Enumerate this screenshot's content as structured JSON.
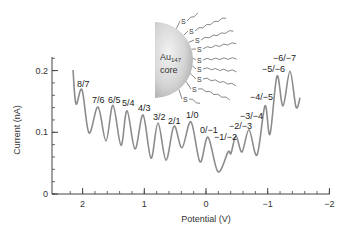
{
  "chart_data": {
    "type": "line",
    "title": "",
    "xlabel": "Potential (V)",
    "ylabel": "Current (nA)",
    "xlim": [
      2.3,
      -2.05
    ],
    "ylim": [
      0,
      0.22
    ],
    "x_reversed": true,
    "grid": false,
    "legend": null,
    "x_ticks": [
      2,
      1,
      0,
      -1,
      -2
    ],
    "x_tick_labels": [
      "2",
      "1",
      "0",
      "−1",
      "−2"
    ],
    "x_minor_step": 0.2,
    "y_ticks": [
      0,
      0.1,
      0.2
    ],
    "y_tick_labels": [
      "0",
      "0.1",
      "0.2"
    ],
    "y_minor_step": 0.02,
    "series": [
      {
        "name": "Au147 DPV",
        "color": "#8c8c8c",
        "x": [
          2.155,
          2.107,
          2.01,
          1.896,
          1.75,
          1.62,
          1.507,
          1.378,
          1.28,
          1.15,
          1.02,
          0.891,
          0.778,
          0.648,
          0.519,
          0.389,
          0.243,
          0.097,
          -0.032,
          -0.194,
          -0.357,
          -0.405,
          -0.486,
          -0.583,
          -0.697,
          -0.827,
          -0.956,
          -1.037,
          -1.15,
          -1.248,
          -1.361,
          -1.459,
          -1.524
        ],
        "y": [
          0.201,
          0.146,
          0.169,
          0.099,
          0.141,
          0.086,
          0.144,
          0.079,
          0.135,
          0.073,
          0.128,
          0.058,
          0.115,
          0.055,
          0.11,
          0.075,
          0.117,
          0.052,
          0.092,
          0.036,
          0.068,
          0.066,
          0.094,
          0.068,
          0.104,
          0.063,
          0.143,
          0.097,
          0.191,
          0.143,
          0.199,
          0.141,
          0.156
        ]
      }
    ],
    "annotations": [
      {
        "text": "8/7",
        "x": 2.01,
        "y": 0.169
      },
      {
        "text": "7/6",
        "x": 1.75,
        "y": 0.141
      },
      {
        "text": "6/5",
        "x": 1.507,
        "y": 0.144
      },
      {
        "text": "5/4",
        "x": 1.28,
        "y": 0.135
      },
      {
        "text": "4/3",
        "x": 1.02,
        "y": 0.128
      },
      {
        "text": "3/2",
        "x": 0.778,
        "y": 0.115
      },
      {
        "text": "2/1",
        "x": 0.519,
        "y": 0.11
      },
      {
        "text": "1/0",
        "x": 0.243,
        "y": 0.117
      },
      {
        "text": "0/−1",
        "x": -0.032,
        "y": 0.092
      },
      {
        "text": "−1/−2",
        "x": -0.486,
        "y": 0.094
      },
      {
        "text": "−2/−3",
        "x": -0.697,
        "y": 0.104
      },
      {
        "text": "−3/−4",
        "x": -0.956,
        "y": 0.143
      },
      {
        "text": "−4/−5",
        "x": -1.15,
        "y": 0.191
      },
      {
        "text": "−5/−6",
        "x": -1.361,
        "y": 0.199
      },
      {
        "text": "−6/−7",
        "x": -1.45,
        "y": 0.215
      }
    ],
    "inset": {
      "description": "Au147 nanoparticle core with thiolate ligands",
      "core_label_line1": "Au",
      "core_label_sub": "147",
      "core_label_line2": "core",
      "ligand_atom": "S",
      "ligand_count": 9
    }
  },
  "layout_px": {
    "x_of_V0": 206,
    "px_per_V": 61.7,
    "y_of_I0": 194,
    "px_per_nA": 617,
    "axis_left": 52,
    "axis_right": 330,
    "axis_top": 57,
    "label_positions": [
      [
        77,
        87
      ],
      [
        92,
        103
      ],
      [
        108,
        103
      ],
      [
        122,
        106
      ],
      [
        138,
        111
      ],
      [
        153,
        120
      ],
      [
        168,
        124
      ],
      [
        186,
        118
      ],
      [
        200,
        133
      ],
      [
        214,
        140
      ],
      [
        229,
        129
      ],
      [
        240,
        119
      ],
      [
        250,
        100
      ],
      [
        262,
        72
      ],
      [
        273,
        61
      ]
    ],
    "s_positions": [
      [
        183,
        22
      ],
      [
        191,
        32
      ],
      [
        197,
        41
      ],
      [
        199,
        50
      ],
      [
        199,
        61
      ],
      [
        199,
        70
      ],
      [
        199,
        80
      ],
      [
        194,
        90
      ],
      [
        185,
        100
      ]
    ]
  }
}
